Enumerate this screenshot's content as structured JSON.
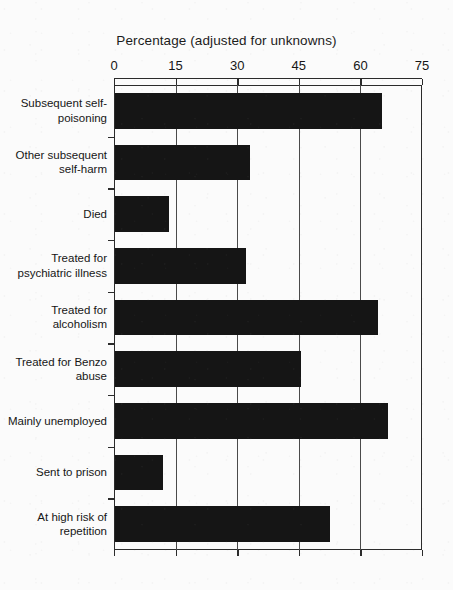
{
  "chart_data": {
    "type": "bar",
    "orientation": "horizontal",
    "title": "Percentage (adjusted for unknowns)",
    "xlabel": "",
    "ylabel": "",
    "xlim": [
      0,
      75
    ],
    "xticks": [
      0,
      15,
      30,
      45,
      60,
      75
    ],
    "xtick_labels": [
      "0",
      "15",
      "30",
      "45",
      "60",
      "75"
    ],
    "grid": true,
    "grid_axis": "x",
    "legend": false,
    "bar_color": "#151515",
    "axis_color": "#2b2b2b",
    "background_color": "#fbfbfb",
    "categories": [
      "Subsequent self-\npoisoning",
      "Other subsequent\nself-harm",
      "Died",
      "Treated for\npsychiatric illness",
      "Treated for\nalcoholism",
      "Treated for Benzo\nabuse",
      "Mainly unemployed",
      "Sent to prison",
      "At high risk of\nrepetition"
    ],
    "values": [
      65.3,
      33.2,
      13.5,
      32.2,
      64.3,
      45.6,
      66.6,
      11.9,
      52.7
    ]
  }
}
